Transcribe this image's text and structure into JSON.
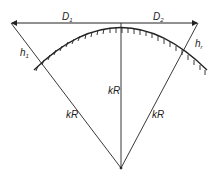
{
  "diagram": {
    "labels": {
      "d1": "D",
      "d1_sub": "1",
      "d2": "D",
      "d2_sub": "2",
      "h1": "h",
      "h1_sub": "1",
      "hr": "h",
      "hr_sub": "r",
      "kr_center": "kR",
      "kr_left": "kR",
      "kr_right": "kR"
    },
    "colors": {
      "line": "#222222",
      "background": "#ffffff"
    }
  }
}
